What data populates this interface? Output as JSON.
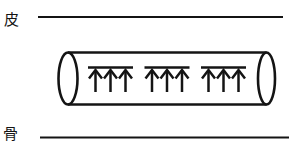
{
  "figure": {
    "background_color": "#ffffff",
    "ink_color": "#141414",
    "labels": {
      "skin": "皮",
      "bone": "骨"
    },
    "tube": {
      "bundles": [
        {
          "arrow_count": 3
        },
        {
          "arrow_count": 3
        },
        {
          "arrow_count": 3
        }
      ]
    }
  }
}
